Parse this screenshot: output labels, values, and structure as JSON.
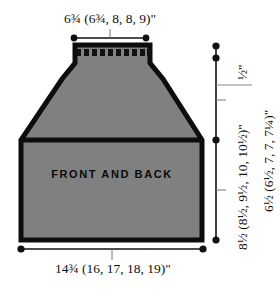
{
  "schematic": {
    "piece_label": "FRONT AND BACK",
    "colors": {
      "fill": "#808080",
      "outline": "#0d0d0d",
      "dimension_line": "#111111",
      "background": "#ffffff",
      "rib_mark": "#111111"
    },
    "dimensions": {
      "top_width": {
        "name": "neck / shoulder width",
        "text": "6¾ (6¾, 8, 8, 9)\"",
        "values": [
          "6¾",
          "6¾",
          "8",
          "8",
          "9"
        ],
        "unit": "\"",
        "orientation": "horizontal",
        "position": "top"
      },
      "bottom_width": {
        "name": "lower body width",
        "text": "14¾ (16, 17, 18, 19)\"",
        "values": [
          "14¾",
          "16",
          "17",
          "18",
          "19"
        ],
        "unit": "\"",
        "orientation": "horizontal",
        "position": "bottom"
      },
      "neckband_height": {
        "name": "neckband height",
        "text": "½\"",
        "values": [
          "½"
        ],
        "unit": "\"",
        "orientation": "vertical",
        "position": "right-inner-top"
      },
      "body_height": {
        "name": "lower body height",
        "text": "8½ (8½, 9½, 10, 10½)\"",
        "values": [
          "8½",
          "8½",
          "9½",
          "10",
          "10½"
        ],
        "unit": "\"",
        "orientation": "vertical",
        "position": "right-inner-bottom"
      },
      "yoke_height": {
        "name": "yoke / upper height",
        "text": "6½ (6½, 7, 7, 7¼)\"",
        "values": [
          "6½",
          "6½",
          "7",
          "7",
          "7¼"
        ],
        "unit": "\"",
        "orientation": "vertical",
        "position": "right-outer"
      }
    },
    "neckband": {
      "name": "ribbed neckband",
      "rib_marks": 10
    }
  }
}
